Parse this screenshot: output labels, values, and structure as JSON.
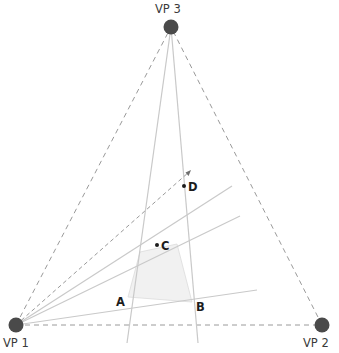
{
  "figure": {
    "background_color": "#ffffff",
    "line_color": "#c9c9c9",
    "dash_color": "#9a9a9a",
    "vp_dot_color": "#4a4a4a",
    "point_dot_color": "#1c1c1c",
    "shade_fill": "#f1f1f1",
    "shade_stroke": "#d8d8d8"
  },
  "vanishing_points": [
    {
      "id": "vp1",
      "label": "VP 1",
      "x": 16,
      "y": 325,
      "r": 7.5,
      "label_x": 3,
      "label_y": 347
    },
    {
      "id": "vp2",
      "label": "VP 2",
      "x": 322,
      "y": 325,
      "r": 7.5,
      "label_x": 305,
      "label_y": 347
    },
    {
      "id": "vp3",
      "label": "VP 3",
      "x": 171,
      "y": 27,
      "r": 7.5,
      "label_x": 155,
      "label_y": 13
    }
  ],
  "points": [
    {
      "id": "a",
      "label": "A",
      "x": 128,
      "y": 297,
      "label_x": 117,
      "label_y": 305,
      "has_dot": false
    },
    {
      "id": "b",
      "label": "B",
      "x": 199,
      "y": 303,
      "label_x": 197,
      "label_y": 310,
      "has_dot": false
    },
    {
      "id": "c",
      "label": "C",
      "x": 157,
      "y": 245,
      "label_x": 161,
      "label_y": 249,
      "has_dot": true,
      "dot_r": 2.0
    },
    {
      "id": "d",
      "label": "D",
      "x": 184,
      "y": 186,
      "label_x": 188,
      "label_y": 190,
      "has_dot": true,
      "dot_r": 2.0
    }
  ],
  "dashed_triangle": {
    "name": "vanishing-point-triangle",
    "vertices": [
      [
        16,
        325
      ],
      [
        322,
        325
      ],
      [
        171,
        27
      ]
    ],
    "dash_pattern": "5,4"
  },
  "solid_lines_from_vp3": [
    {
      "name": "vp3-line-left",
      "x1": 171,
      "y1": 27,
      "x2": 127,
      "y2": 343
    },
    {
      "name": "vp3-line-right",
      "x1": 171,
      "y1": 27,
      "x2": 198,
      "y2": 343
    }
  ],
  "solid_lines_from_vp1": [
    {
      "name": "vp1-ray-upper",
      "x1": 16,
      "y1": 325,
      "x2": 232,
      "y2": 186
    },
    {
      "name": "vp1-ray-middle",
      "x1": 16,
      "y1": 325,
      "x2": 240,
      "y2": 216
    },
    {
      "name": "vp1-ray-lower",
      "x1": 16,
      "y1": 325,
      "x2": 257,
      "y2": 290
    }
  ],
  "dashed_ray": {
    "name": "vp1-dashed-ray-through-c-d",
    "x1": 16,
    "y1": 325,
    "x2": 189,
    "y2": 172,
    "dash_pattern": "4,3",
    "arrow": {
      "tip_x": 191,
      "tip_y": 170,
      "size": 4.5
    }
  },
  "shaded_quad": {
    "name": "shaded-face",
    "points": "140,252 177,244 192,302 128,297"
  }
}
